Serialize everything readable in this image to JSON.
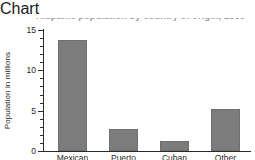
{
  "chart_data": {
    "type": "bar",
    "title": "Hispanic population by country of origin, 2000",
    "title_visible": false,
    "xlabel": "",
    "ylabel": "Population in millions",
    "categories": [
      "Mexican",
      "Puerto Rican",
      "Cuban",
      "Other"
    ],
    "category_lines": [
      [
        "Mexican"
      ],
      [
        "Puerto",
        "Rican"
      ],
      [
        "Cuban"
      ],
      [
        "Other"
      ]
    ],
    "values": [
      13.7,
      2.7,
      1.2,
      5.2
    ],
    "ylim": [
      0,
      15
    ],
    "ytick_labels": [
      "0",
      "5",
      "10",
      "15"
    ],
    "ytick_values": [
      0,
      5,
      10,
      15
    ],
    "yminor_step": 1,
    "grid": false,
    "legend": false,
    "bar_color": "#7c7c7c",
    "axis_color": "#2b2b2b",
    "background_color": "#ffffff"
  }
}
